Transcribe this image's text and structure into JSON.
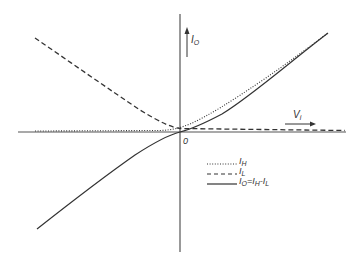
{
  "figure": {
    "colors": {
      "axis": "#555555",
      "curve": "#333333",
      "background": "#ffffff"
    },
    "axes": {
      "y_label_main": "I",
      "y_label_sub": "O",
      "x_label_main": "V",
      "x_label_sub": "i",
      "origin_label": "0"
    },
    "legend": {
      "items": [
        {
          "style": "dotted",
          "main": "I",
          "sub": "H",
          "rest": ""
        },
        {
          "style": "dashed",
          "main": "I",
          "sub": "L",
          "rest": ""
        },
        {
          "style": "solid",
          "main": "I",
          "sub": "O",
          "rest_parts": [
            "=I",
            "H",
            "-I",
            "L"
          ]
        }
      ]
    },
    "curves": [
      {
        "name": "I_H",
        "style": "dotted",
        "description": "near zero for negative V_i, rises for positive V_i"
      },
      {
        "name": "I_L",
        "style": "dashed",
        "description": "rises for negative V_i, near zero for positive V_i"
      },
      {
        "name": "I_O",
        "style": "solid",
        "description": "I_H - I_L, odd-symmetric through origin"
      }
    ]
  }
}
